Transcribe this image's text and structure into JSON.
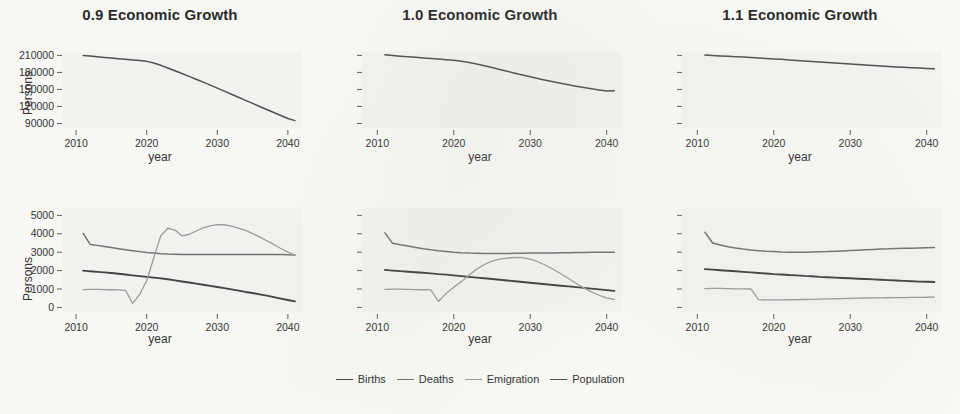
{
  "figure": {
    "xlabel": "year",
    "ylabel": "Persons",
    "legend_position": "bottom"
  },
  "series_styles": [
    {
      "key": "births",
      "label": "Births",
      "color": "#3a3a3a",
      "width": 1.9
    },
    {
      "key": "deaths",
      "label": "Deaths",
      "color": "#6e6e6e",
      "width": 1.5
    },
    {
      "key": "emigration",
      "label": "Emigration",
      "color": "#9a9a9a",
      "width": 1.3
    },
    {
      "key": "population",
      "label": "Population",
      "color": "#4a4a4a",
      "width": 1.5
    }
  ],
  "chart_data": [
    {
      "type": "line",
      "panel": "top-left",
      "title": "0.9 Economic Growth",
      "xlabel": "year",
      "ylabel": "Persons",
      "xlim": [
        2008,
        2042
      ],
      "ylim": [
        82000,
        216000
      ],
      "xticks": [
        2010,
        2020,
        2030,
        2040
      ],
      "yticks": [
        90000,
        120000,
        150000,
        180000,
        210000
      ],
      "ytick_labels": [
        "90000",
        "120000",
        "150000",
        "180000",
        "210000"
      ],
      "show_ytick_labels": true,
      "grid": false,
      "x": [
        2011,
        2012,
        2013,
        2014,
        2015,
        2016,
        2017,
        2018,
        2019,
        2020,
        2021,
        2022,
        2023,
        2024,
        2025,
        2026,
        2027,
        2028,
        2029,
        2030,
        2031,
        2032,
        2033,
        2034,
        2035,
        2036,
        2037,
        2038,
        2039,
        2040,
        2041
      ],
      "series": [
        {
          "name": "Population",
          "key": "population",
          "values": [
            210000,
            208800,
            207600,
            206400,
            205300,
            204200,
            203100,
            202000,
            200800,
            199500,
            196500,
            192500,
            187800,
            183000,
            178100,
            173100,
            168000,
            162800,
            157600,
            152300,
            147000,
            141600,
            136200,
            130800,
            125400,
            120000,
            114600,
            109300,
            104000,
            98800,
            95000
          ]
        }
      ]
    },
    {
      "type": "line",
      "panel": "top-middle",
      "title": "1.0 Economic Growth",
      "xlabel": "year",
      "ylabel": "Persons",
      "xlim": [
        2008,
        2042
      ],
      "ylim": [
        82000,
        216000
      ],
      "xticks": [
        2010,
        2020,
        2030,
        2040
      ],
      "yticks": [
        90000,
        120000,
        150000,
        180000,
        210000
      ],
      "ytick_labels": [
        "",
        "",
        "",
        "",
        ""
      ],
      "show_ytick_labels": false,
      "grid": false,
      "x": [
        2011,
        2012,
        2013,
        2014,
        2015,
        2016,
        2017,
        2018,
        2019,
        2020,
        2021,
        2022,
        2023,
        2024,
        2025,
        2026,
        2027,
        2028,
        2029,
        2030,
        2031,
        2032,
        2033,
        2034,
        2035,
        2036,
        2037,
        2038,
        2039,
        2040,
        2041
      ],
      "series": [
        {
          "name": "Population",
          "key": "population",
          "values": [
            211000,
            209800,
            208700,
            207600,
            206600,
            205600,
            204600,
            203600,
            202500,
            201500,
            199800,
            197600,
            194900,
            191800,
            188600,
            185300,
            182000,
            178700,
            175400,
            172200,
            169200,
            166300,
            163500,
            160800,
            158200,
            155700,
            153300,
            151100,
            149000,
            147200,
            147500
          ]
        }
      ]
    },
    {
      "type": "line",
      "panel": "top-right",
      "title": "1.1 Economic Growth",
      "xlabel": "year",
      "ylabel": "Persons",
      "xlim": [
        2008,
        2042
      ],
      "ylim": [
        82000,
        216000
      ],
      "xticks": [
        2010,
        2020,
        2030,
        2040
      ],
      "yticks": [
        90000,
        120000,
        150000,
        180000,
        210000
      ],
      "ytick_labels": [
        "",
        "",
        "",
        "",
        ""
      ],
      "show_ytick_labels": false,
      "grid": false,
      "x": [
        2011,
        2012,
        2013,
        2014,
        2015,
        2016,
        2017,
        2018,
        2019,
        2020,
        2021,
        2022,
        2023,
        2024,
        2025,
        2026,
        2027,
        2028,
        2029,
        2030,
        2031,
        2032,
        2033,
        2034,
        2035,
        2036,
        2037,
        2038,
        2039,
        2040,
        2041
      ],
      "series": [
        {
          "name": "Population",
          "key": "population",
          "values": [
            210500,
            209800,
            209100,
            208400,
            207700,
            207000,
            206200,
            205400,
            204600,
            203800,
            203000,
            202100,
            201200,
            200300,
            199400,
            198400,
            197500,
            196600,
            195700,
            194800,
            193900,
            193000,
            192100,
            191300,
            190500,
            189700,
            188900,
            188200,
            187600,
            187000,
            186500
          ]
        }
      ]
    },
    {
      "type": "line",
      "panel": "bottom-left",
      "title": "0.9 Economic Growth",
      "xlabel": "year",
      "ylabel": "Persons",
      "xlim": [
        2008,
        2042
      ],
      "ylim": [
        -250,
        5400
      ],
      "xticks": [
        2010,
        2020,
        2030,
        2040
      ],
      "yticks": [
        0,
        1000,
        2000,
        3000,
        4000,
        5000
      ],
      "ytick_labels": [
        "0",
        "1000",
        "2000",
        "3000",
        "4000",
        "5000"
      ],
      "show_ytick_labels": true,
      "grid": false,
      "x": [
        2011,
        2012,
        2013,
        2014,
        2015,
        2016,
        2017,
        2018,
        2019,
        2020,
        2021,
        2022,
        2023,
        2024,
        2025,
        2026,
        2027,
        2028,
        2029,
        2030,
        2031,
        2032,
        2033,
        2034,
        2035,
        2036,
        2037,
        2038,
        2039,
        2040,
        2041
      ],
      "series": [
        {
          "name": "Births",
          "key": "births",
          "values": [
            2000,
            1960,
            1930,
            1900,
            1870,
            1830,
            1790,
            1740,
            1700,
            1660,
            1620,
            1580,
            1530,
            1470,
            1410,
            1350,
            1290,
            1230,
            1170,
            1110,
            1050,
            980,
            910,
            840,
            780,
            710,
            640,
            560,
            480,
            400,
            330
          ]
        },
        {
          "name": "Deaths",
          "key": "deaths",
          "values": [
            4020,
            3420,
            3370,
            3310,
            3250,
            3190,
            3130,
            3080,
            3030,
            2980,
            2950,
            2920,
            2900,
            2890,
            2880,
            2880,
            2880,
            2870,
            2870,
            2870,
            2870,
            2870,
            2870,
            2870,
            2870,
            2870,
            2870,
            2870,
            2870,
            2860,
            2850
          ]
        },
        {
          "name": "Emigration",
          "key": "emigration",
          "values": [
            970,
            980,
            980,
            970,
            960,
            950,
            930,
            220,
            700,
            1450,
            2700,
            3900,
            4300,
            4200,
            3880,
            3960,
            4150,
            4320,
            4430,
            4500,
            4490,
            4420,
            4310,
            4180,
            4010,
            3830,
            3620,
            3420,
            3200,
            3000,
            2840
          ]
        }
      ]
    },
    {
      "type": "line",
      "panel": "bottom-middle",
      "title": "1.0 Economic Growth",
      "xlabel": "year",
      "ylabel": "Persons",
      "xlim": [
        2008,
        2042
      ],
      "ylim": [
        -250,
        5400
      ],
      "xticks": [
        2010,
        2020,
        2030,
        2040
      ],
      "yticks": [
        0,
        1000,
        2000,
        3000,
        4000,
        5000
      ],
      "ytick_labels": [
        "",
        "",
        "",
        "",
        "",
        ""
      ],
      "show_ytick_labels": false,
      "grid": false,
      "x": [
        2011,
        2012,
        2013,
        2014,
        2015,
        2016,
        2017,
        2018,
        2019,
        2020,
        2021,
        2022,
        2023,
        2024,
        2025,
        2026,
        2027,
        2028,
        2029,
        2030,
        2031,
        2032,
        2033,
        2034,
        2035,
        2036,
        2037,
        2038,
        2039,
        2040,
        2041
      ],
      "series": [
        {
          "name": "Births",
          "key": "births",
          "values": [
            2040,
            2000,
            1970,
            1940,
            1910,
            1880,
            1850,
            1810,
            1780,
            1740,
            1700,
            1660,
            1620,
            1580,
            1540,
            1500,
            1460,
            1420,
            1380,
            1340,
            1300,
            1260,
            1220,
            1180,
            1140,
            1100,
            1060,
            1020,
            980,
            940,
            900
          ]
        },
        {
          "name": "Deaths",
          "key": "deaths",
          "values": [
            4050,
            3480,
            3400,
            3330,
            3260,
            3190,
            3130,
            3080,
            3040,
            3000,
            2970,
            2950,
            2940,
            2930,
            2930,
            2930,
            2930,
            2940,
            2940,
            2950,
            2950,
            2960,
            2960,
            2970,
            2970,
            2980,
            2980,
            2990,
            2990,
            3000,
            3000
          ]
        },
        {
          "name": "Emigration",
          "key": "emigration",
          "values": [
            980,
            990,
            990,
            980,
            970,
            960,
            950,
            320,
            760,
            1100,
            1400,
            1760,
            2080,
            2330,
            2510,
            2620,
            2680,
            2710,
            2700,
            2620,
            2480,
            2290,
            2070,
            1830,
            1570,
            1310,
            1060,
            840,
            660,
            520,
            430
          ]
        }
      ]
    },
    {
      "type": "line",
      "panel": "bottom-right",
      "title": "1.1 Economic Growth",
      "xlabel": "year",
      "ylabel": "Persons",
      "xlim": [
        2008,
        2042
      ],
      "ylim": [
        -250,
        5400
      ],
      "xticks": [
        2010,
        2020,
        2030,
        2040
      ],
      "yticks": [
        0,
        1000,
        2000,
        3000,
        4000,
        5000
      ],
      "ytick_labels": [
        "",
        "",
        "",
        "",
        "",
        ""
      ],
      "show_ytick_labels": false,
      "grid": false,
      "x": [
        2011,
        2012,
        2013,
        2014,
        2015,
        2016,
        2017,
        2018,
        2019,
        2020,
        2021,
        2022,
        2023,
        2024,
        2025,
        2026,
        2027,
        2028,
        2029,
        2030,
        2031,
        2032,
        2033,
        2034,
        2035,
        2036,
        2037,
        2038,
        2039,
        2040,
        2041
      ],
      "series": [
        {
          "name": "Births",
          "key": "births",
          "values": [
            2080,
            2050,
            2020,
            1990,
            1960,
            1930,
            1900,
            1870,
            1840,
            1810,
            1790,
            1760,
            1740,
            1710,
            1690,
            1660,
            1640,
            1620,
            1600,
            1580,
            1560,
            1540,
            1520,
            1500,
            1480,
            1460,
            1440,
            1420,
            1400,
            1390,
            1380
          ]
        },
        {
          "name": "Deaths",
          "key": "deaths",
          "values": [
            4080,
            3500,
            3390,
            3300,
            3230,
            3170,
            3120,
            3080,
            3050,
            3030,
            3010,
            3000,
            3000,
            3000,
            3010,
            3020,
            3030,
            3050,
            3070,
            3090,
            3110,
            3130,
            3150,
            3170,
            3180,
            3200,
            3210,
            3220,
            3230,
            3240,
            3250
          ]
        },
        {
          "name": "Emigration",
          "key": "emigration",
          "values": [
            1020,
            1030,
            1030,
            1020,
            1010,
            1005,
            1000,
            420,
            410,
            405,
            410,
            415,
            420,
            430,
            440,
            450,
            460,
            470,
            480,
            490,
            500,
            510,
            515,
            520,
            525,
            530,
            535,
            540,
            545,
            550,
            555
          ]
        }
      ]
    }
  ],
  "legend": {
    "items": [
      {
        "label": "Births",
        "color": "#3a3a3a"
      },
      {
        "label": "Deaths",
        "color": "#6e6e6e"
      },
      {
        "label": "Emigration",
        "color": "#9a9a9a"
      },
      {
        "label": "Population",
        "color": "#4a4a4a"
      }
    ]
  }
}
